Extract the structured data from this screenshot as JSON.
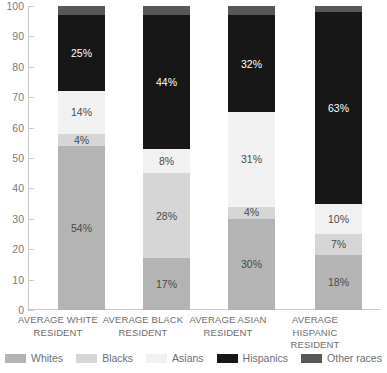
{
  "chart_data": {
    "type": "bar",
    "subtype": "stacked-bar-100-percent",
    "title": "",
    "xlabel": "",
    "ylabel": "",
    "ylim": [
      0,
      100
    ],
    "yticks": [
      0,
      10,
      20,
      30,
      40,
      50,
      60,
      70,
      80,
      90,
      100
    ],
    "ytick_labels": [
      "0",
      "10",
      "20",
      "30",
      "40",
      "50",
      "60",
      "70",
      "80",
      "90",
      "100"
    ],
    "grid": false,
    "legend_position": "bottom",
    "categories": [
      "AVERAGE WHITE RESIDENT",
      "AVERAGE BLACK RESIDENT",
      "AVERAGE ASIAN RESIDENT",
      "AVERAGE HISPANIC RESIDENT"
    ],
    "category_lines": [
      [
        "AVERAGE WHITE",
        "RESIDENT"
      ],
      [
        "AVERAGE BLACK",
        "RESIDENT"
      ],
      [
        "AVERAGE ASIAN",
        "RESIDENT"
      ],
      [
        "AVERAGE HISPANIC",
        "RESIDENT"
      ]
    ],
    "series": [
      {
        "name": "Whites",
        "color": "#b4b4b4",
        "label_color": "#4a4a4a",
        "values": [
          54,
          17,
          30,
          18
        ],
        "labels": [
          "54%",
          "17%",
          "30%",
          "18%"
        ]
      },
      {
        "name": "Blacks",
        "color": "#d6d6d6",
        "label_color": "#4a4a4a",
        "values": [
          4,
          28,
          4,
          7
        ],
        "labels": [
          "4%",
          "28%",
          "4%",
          "7%"
        ]
      },
      {
        "name": "Asians",
        "color": "#f1f1f1",
        "label_color": "#4a4a4a",
        "values": [
          14,
          8,
          31,
          10
        ],
        "labels": [
          "14%",
          "8%",
          "31%",
          "10%"
        ]
      },
      {
        "name": "Hispanics",
        "color": "#171717",
        "label_color": "#ffffff",
        "values": [
          25,
          44,
          32,
          63
        ],
        "labels": [
          "25%",
          "44%",
          "32%",
          "63%"
        ]
      },
      {
        "name": "Other races",
        "color": "#585858",
        "label_color": "#ffffff",
        "values": [
          3,
          3,
          3,
          2
        ],
        "labels": [
          "",
          "",
          "",
          ""
        ]
      }
    ]
  },
  "legend": {
    "items": [
      {
        "label": "Whites",
        "color": "#b4b4b4"
      },
      {
        "label": "Blacks",
        "color": "#d6d6d6"
      },
      {
        "label": "Asians",
        "color": "#f1f1f1"
      },
      {
        "label": "Hispanics",
        "color": "#171717"
      },
      {
        "label": "Other races",
        "color": "#585858"
      }
    ]
  },
  "axis": {
    "line_color": "#c9c9c9",
    "tick_color": "#c9c9c9",
    "label_color": "#7a7a7a"
  }
}
